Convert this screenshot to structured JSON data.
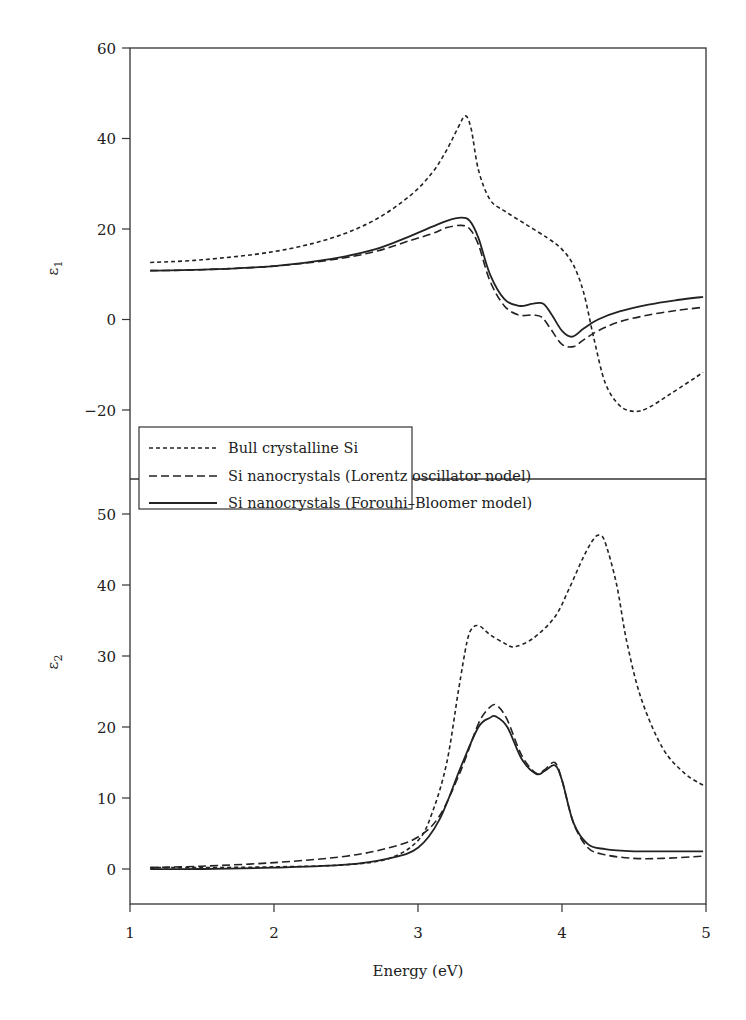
{
  "chart_data": [
    {
      "type": "line",
      "panel": "top",
      "title": "",
      "xlabel": "Energy (eV)",
      "ylabel": "ε1",
      "xlim": [
        1,
        5
      ],
      "ylim": [
        -25,
        60
      ],
      "yticks": [
        60,
        40,
        20,
        0,
        -20
      ],
      "grid": false,
      "series": [
        {
          "name": "Bull crystalline Si",
          "style": "short-dash",
          "x": [
            1.14,
            1.5,
            2.0,
            2.4,
            2.7,
            2.95,
            3.1,
            3.2,
            3.28,
            3.33,
            3.37,
            3.42,
            3.5,
            3.6,
            3.75,
            3.9,
            4.0,
            4.08,
            4.15,
            4.22,
            4.3,
            4.4,
            4.5,
            4.6,
            4.75,
            4.98
          ],
          "values": [
            12.6,
            13.2,
            15.0,
            18.0,
            22.0,
            27.5,
            32.5,
            37.5,
            42.5,
            45.0,
            42.0,
            33.0,
            26.5,
            24.0,
            21.0,
            18.0,
            15.5,
            12.0,
            6.0,
            -4.0,
            -14.0,
            -19.0,
            -20.3,
            -19.5,
            -16.5,
            -11.7
          ]
        },
        {
          "name": "Si nanocrystals (Lorentz oscillator nodel)",
          "style": "long-dash",
          "x": [
            1.14,
            1.5,
            2.0,
            2.4,
            2.7,
            2.95,
            3.1,
            3.2,
            3.3,
            3.36,
            3.42,
            3.5,
            3.6,
            3.7,
            3.8,
            3.86,
            3.92,
            4.0,
            4.08,
            4.15,
            4.25,
            4.4,
            4.6,
            4.8,
            4.98
          ],
          "values": [
            10.8,
            11.0,
            11.8,
            13.2,
            15.0,
            17.5,
            19.0,
            20.3,
            20.8,
            20.0,
            16.5,
            8.5,
            3.0,
            1.0,
            1.0,
            0.5,
            -2.0,
            -5.5,
            -6.0,
            -4.5,
            -2.5,
            -0.5,
            1.0,
            2.0,
            2.7
          ]
        },
        {
          "name": "Si nanocrystals (Forouhi–Bloomer model)",
          "style": "solid",
          "x": [
            1.14,
            1.5,
            2.0,
            2.4,
            2.7,
            2.95,
            3.1,
            3.2,
            3.3,
            3.36,
            3.42,
            3.5,
            3.6,
            3.7,
            3.8,
            3.87,
            3.93,
            4.0,
            4.07,
            4.15,
            4.25,
            4.4,
            4.6,
            4.8,
            4.98
          ],
          "values": [
            10.8,
            11.0,
            11.8,
            13.4,
            15.5,
            18.5,
            20.5,
            21.8,
            22.5,
            21.8,
            18.0,
            10.0,
            4.5,
            3.0,
            3.5,
            3.5,
            1.0,
            -2.5,
            -3.8,
            -2.0,
            0.0,
            1.8,
            3.3,
            4.3,
            5.0
          ]
        }
      ]
    },
    {
      "type": "line",
      "panel": "bottom",
      "title": "",
      "xlabel": "Energy (eV)",
      "ylabel": "ε2",
      "xlim": [
        1,
        5
      ],
      "ylim": [
        -5,
        57
      ],
      "yticks": [
        50,
        40,
        30,
        20,
        10,
        0
      ],
      "xticks": [
        1,
        2,
        3,
        4,
        5
      ],
      "grid": false,
      "series": [
        {
          "name": "Bull crystalline Si",
          "style": "short-dash",
          "x": [
            1.14,
            1.5,
            2.0,
            2.5,
            2.8,
            3.0,
            3.1,
            3.2,
            3.28,
            3.34,
            3.38,
            3.43,
            3.5,
            3.6,
            3.67,
            3.8,
            3.95,
            4.05,
            4.15,
            4.22,
            4.26,
            4.3,
            4.38,
            4.45,
            4.55,
            4.7,
            4.85,
            4.98
          ],
          "values": [
            0.2,
            0.2,
            0.3,
            0.6,
            1.5,
            4.0,
            8.0,
            15.0,
            25.0,
            32.0,
            34.0,
            34.2,
            33.0,
            31.8,
            31.3,
            32.5,
            35.5,
            39.5,
            44.0,
            46.5,
            47.0,
            46.0,
            40.0,
            32.0,
            24.0,
            17.0,
            13.5,
            11.8
          ]
        },
        {
          "name": "Si nanocrystals (Lorentz oscillator nodel)",
          "style": "long-dash",
          "x": [
            1.14,
            1.5,
            2.0,
            2.5,
            2.8,
            3.0,
            3.15,
            3.3,
            3.42,
            3.5,
            3.55,
            3.62,
            3.72,
            3.82,
            3.88,
            3.95,
            4.0,
            4.08,
            4.18,
            4.3,
            4.5,
            4.7,
            4.98
          ],
          "values": [
            0.2,
            0.4,
            0.9,
            1.8,
            3.0,
            4.5,
            7.5,
            14.0,
            20.5,
            22.8,
            23.0,
            21.0,
            16.0,
            13.5,
            14.0,
            15.0,
            12.5,
            6.5,
            3.0,
            2.0,
            1.5,
            1.5,
            1.8
          ]
        },
        {
          "name": "Si nanocrystals (Forouhi–Bloomer model)",
          "style": "solid",
          "x": [
            1.14,
            1.5,
            2.0,
            2.5,
            2.8,
            3.0,
            3.15,
            3.3,
            3.42,
            3.5,
            3.54,
            3.62,
            3.72,
            3.82,
            3.88,
            3.95,
            4.0,
            4.08,
            4.18,
            4.3,
            4.5,
            4.7,
            4.98
          ],
          "values": [
            0.0,
            0.0,
            0.2,
            0.6,
            1.5,
            3.0,
            7.0,
            14.5,
            20.0,
            21.3,
            21.5,
            20.0,
            15.5,
            13.4,
            13.8,
            14.6,
            12.5,
            6.5,
            3.5,
            2.8,
            2.5,
            2.5,
            2.5
          ]
        }
      ]
    }
  ],
  "axes": {
    "x_title": "Energy (eV)",
    "x_ticks": [
      "1",
      "2",
      "3",
      "4",
      "5"
    ],
    "top_y_title_base": "ε",
    "top_y_title_sub": "1",
    "top_y_ticks": [
      "60",
      "40",
      "20",
      "0",
      "−20"
    ],
    "bottom_y_title_base": "ε",
    "bottom_y_title_sub": "2",
    "bottom_y_ticks": [
      "50",
      "40",
      "30",
      "20",
      "10",
      "0"
    ]
  },
  "legend": {
    "items": [
      {
        "label": "Bull crystalline Si",
        "style": "short-dash"
      },
      {
        "label": "Si nanocrystals (Lorentz oscillator nodel)",
        "style": "long-dash"
      },
      {
        "label": "Si nanocrystals (Forouhi–Bloomer model)",
        "style": "solid"
      }
    ]
  },
  "colors": {
    "line": "#222222",
    "axis": "#333333",
    "background": "#ffffff"
  }
}
